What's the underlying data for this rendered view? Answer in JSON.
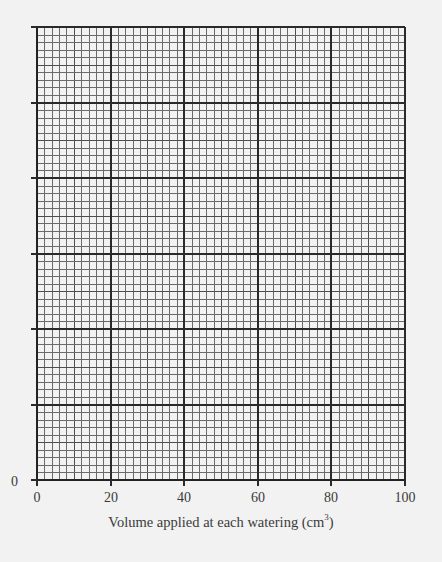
{
  "chart_data": {
    "type": "line",
    "title": "",
    "xlabel": "Volume applied at each watering (cm",
    "xlabel_superscript": "3",
    "xlabel_suffix": ")",
    "ylabel": "",
    "x_ticks": [
      "0",
      "20",
      "40",
      "60",
      "80",
      "100"
    ],
    "y_ticks": [
      "0"
    ],
    "xlim": [
      0,
      100
    ],
    "y_major_divisions": 6,
    "x_major_divisions": 5,
    "minor_per_major": 10,
    "grid": true,
    "series": [],
    "note": "Blank graph paper grid for plotting; no data plotted"
  },
  "layout": {
    "plot_left": 37,
    "plot_top": 27,
    "plot_right": 405,
    "plot_bottom": 480,
    "colors": {
      "background": "#f2f2f2",
      "minor_grid": "#6a6a6a",
      "major_grid": "#2a2a2a",
      "text": "#3a3a3a"
    }
  }
}
